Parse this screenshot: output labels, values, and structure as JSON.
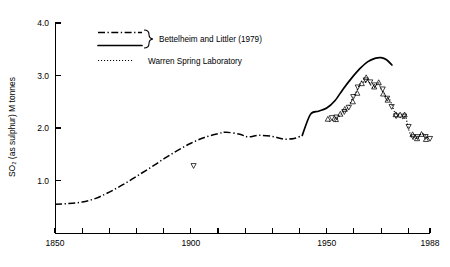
{
  "chart_data": {
    "type": "line",
    "title": "",
    "xlabel": "",
    "ylabel": "SO₂ (as sulphur) M tonnes",
    "xlim": [
      1850,
      1988
    ],
    "ylim": [
      0,
      4.0
    ],
    "grid": false,
    "x_ticks": [
      1850,
      1860,
      1870,
      1880,
      1890,
      1900,
      1910,
      1920,
      1930,
      1940,
      1950,
      1960,
      1970,
      1980
    ],
    "x_tick_labels": [
      "1850",
      "",
      "",
      "",
      "",
      "1900",
      "",
      "",
      "",
      "",
      "1950",
      "",
      "",
      ""
    ],
    "x_end_label": "1988",
    "y_ticks": [
      1.0,
      2.0,
      3.0,
      4.0
    ],
    "y_tick_labels": [
      "1.0",
      "2.0",
      "3.0",
      "4.0"
    ],
    "legend_position": "top-center",
    "series": [
      {
        "name": "Bettelheim and Littler (1979)",
        "style": "dash-dot",
        "x": [
          1850,
          1855,
          1860,
          1865,
          1870,
          1875,
          1880,
          1885,
          1890,
          1895,
          1900,
          1905,
          1910,
          1913,
          1918,
          1921,
          1925,
          1930,
          1934,
          1938,
          1941
        ],
        "values": [
          0.55,
          0.56,
          0.59,
          0.66,
          0.78,
          0.92,
          1.08,
          1.24,
          1.41,
          1.57,
          1.71,
          1.82,
          1.89,
          1.92,
          1.88,
          1.83,
          1.86,
          1.84,
          1.79,
          1.8,
          1.86
        ]
      },
      {
        "name": "Bettelheim and Littler (1979) solid",
        "style": "solid",
        "x": [
          1941,
          1944,
          1947,
          1950,
          1953,
          1956,
          1959,
          1962,
          1965,
          1968,
          1970,
          1972,
          1974
        ],
        "values": [
          1.86,
          2.26,
          2.32,
          2.38,
          2.52,
          2.74,
          2.94,
          3.12,
          3.26,
          3.33,
          3.34,
          3.3,
          3.2
        ]
      },
      {
        "name": "Warren Spring Laboratory",
        "style": "dotted",
        "markers": "open-triangle",
        "x": [
          1951,
          1952,
          1953,
          1954,
          1955,
          1956,
          1957,
          1958,
          1959,
          1960,
          1961,
          1962,
          1963,
          1964,
          1965,
          1966,
          1967,
          1968,
          1969,
          1970,
          1971,
          1972,
          1973,
          1974,
          1975,
          1976,
          1977,
          1978,
          1979,
          1980,
          1981,
          1982,
          1983,
          1984,
          1985,
          1986,
          1987,
          1988
        ],
        "values": [
          2.12,
          2.15,
          2.13,
          2.18,
          2.25,
          2.3,
          2.36,
          2.4,
          2.52,
          2.62,
          2.7,
          2.82,
          2.9,
          2.86,
          2.92,
          2.84,
          2.76,
          2.8,
          2.86,
          2.74,
          2.66,
          2.58,
          2.56,
          2.44,
          2.3,
          2.28,
          2.2,
          2.18,
          2.22,
          2.0,
          1.86,
          1.82,
          1.8,
          1.84,
          1.9,
          1.86,
          1.82,
          1.84
        ]
      },
      {
        "name": "isolated-observations",
        "style": "markers-only",
        "markers": "open-triangle",
        "x": [
          1901
        ],
        "values": [
          1.28
        ]
      }
    ],
    "legend": [
      {
        "label": "Bettelheim and Littler (1979)",
        "keys": [
          "dash-dot",
          "solid"
        ],
        "braced": true
      },
      {
        "label": "Warren Spring Laboratory",
        "keys": [
          "dotted"
        ],
        "braced": false
      }
    ]
  }
}
